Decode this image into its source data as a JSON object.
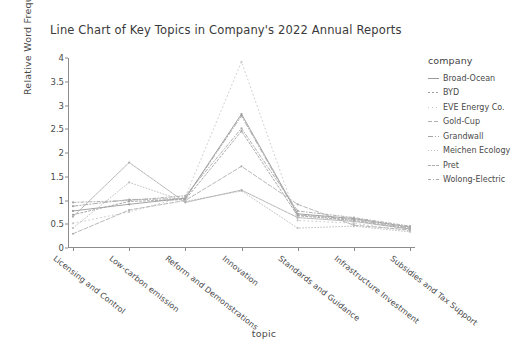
{
  "chart_data": {
    "type": "line",
    "title": "Line Chart of Key Topics in Company's 2022 Annual Reports",
    "xlabel": "topic",
    "ylabel": "Relative Word Frequency",
    "ylim": [
      0,
      4
    ],
    "yticks": [
      "0",
      "0.5",
      "1",
      "1.5",
      "2",
      "2.5",
      "3",
      "3.5",
      "4"
    ],
    "ytick_values": [
      0,
      0.5,
      1,
      1.5,
      2,
      2.5,
      3,
      3.5,
      4
    ],
    "grid": false,
    "legend_title": "company",
    "legend_position": "right",
    "categories": [
      "Licensing and Control",
      "Low-carbon emission",
      "Reform and Demonstrations",
      "Innovation",
      "Standards and Guidance",
      "Infrastructure Investment",
      "Subsidies and Tax Support"
    ],
    "series": [
      {
        "name": "Broad-Ocean",
        "dash": "none",
        "color": "#9a9a9a",
        "values": [
          0.78,
          0.92,
          1.05,
          2.82,
          0.72,
          0.62,
          0.44
        ]
      },
      {
        "name": "BYD",
        "dash": "2,2",
        "color": "#9f9f9f",
        "values": [
          0.7,
          0.98,
          1.02,
          2.46,
          0.68,
          0.58,
          0.4
        ]
      },
      {
        "name": "EVE Energy Co.",
        "dash": "1,3",
        "color": "#c8c8c8",
        "values": [
          0.52,
          0.76,
          1.08,
          3.92,
          0.58,
          0.52,
          0.36
        ]
      },
      {
        "name": "Gold-Cup",
        "dash": "4,2",
        "color": "#b0b0b0",
        "values": [
          0.3,
          0.8,
          1.0,
          1.72,
          0.92,
          0.48,
          0.38
        ]
      },
      {
        "name": "Grandwall",
        "dash": "5,2,1,2",
        "color": "#a5a5a5",
        "values": [
          0.88,
          1.02,
          1.04,
          2.78,
          0.7,
          0.6,
          0.42
        ]
      },
      {
        "name": "Meichen Ecology",
        "dash": "1,2",
        "color": "#c0c0c0",
        "values": [
          0.42,
          1.38,
          0.98,
          1.2,
          0.42,
          0.46,
          0.34
        ]
      },
      {
        "name": "Pret",
        "dash": "3,1",
        "color": "#aeaeae",
        "values": [
          0.66,
          1.8,
          0.96,
          1.22,
          0.64,
          0.56,
          0.4
        ]
      },
      {
        "name": "Wolong-Electric",
        "dash": "3,2,1,2",
        "color": "#a8a8a8",
        "values": [
          0.96,
          1.0,
          1.1,
          2.52,
          0.78,
          0.64,
          0.46
        ]
      }
    ]
  }
}
